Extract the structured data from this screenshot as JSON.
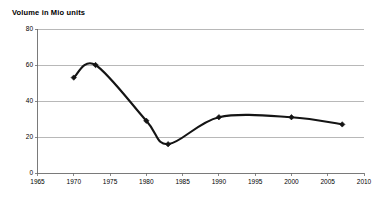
{
  "chart_data": {
    "type": "line",
    "title": "Volume in Mio units",
    "xlabel": "",
    "ylabel": "",
    "xlim": [
      1965,
      2010
    ],
    "ylim": [
      0,
      80
    ],
    "grid": true,
    "legend": "none",
    "x_ticks": [
      "1965",
      "1970",
      "1975",
      "1980",
      "1985",
      "1990",
      "1995",
      "2000",
      "2005",
      "2010"
    ],
    "y_ticks": [
      "0",
      "20",
      "40",
      "60",
      "80"
    ],
    "series": [
      {
        "name": "Volume",
        "color": "#141414",
        "marker": "diamond",
        "x": [
          1970,
          1973,
          1980,
          1983,
          1990,
          2000,
          2007
        ],
        "values": [
          53,
          60,
          29,
          16,
          31,
          31,
          27
        ],
        "points": [
          {
            "x": 1970,
            "y": 53
          },
          {
            "x": 1973,
            "y": 60
          },
          {
            "x": 1980,
            "y": 29
          },
          {
            "x": 1983,
            "y": 16
          },
          {
            "x": 1990,
            "y": 31
          },
          {
            "x": 2000,
            "y": 31
          },
          {
            "x": 2007,
            "y": 27
          }
        ]
      }
    ]
  },
  "axis": {
    "y_tick_values": [
      0,
      20,
      40,
      60,
      80
    ],
    "x_tick_values": [
      1965,
      1970,
      1975,
      1980,
      1985,
      1990,
      1995,
      2000,
      2005,
      2010
    ]
  },
  "colors": {
    "line": "#141414",
    "grid": "#9a9a9a",
    "axis": "#6b6b6b",
    "text": "#000000",
    "background": "#ffffff"
  }
}
